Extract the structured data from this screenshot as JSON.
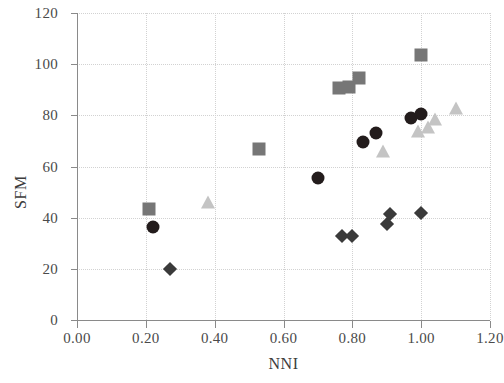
{
  "chart_data": {
    "type": "scatter",
    "title": "",
    "xlabel": "NNI",
    "ylabel": "SFM",
    "xlim": [
      0.0,
      1.2
    ],
    "ylim": [
      0,
      120
    ],
    "grid": true,
    "legend": "none",
    "xticks": [
      "0.00",
      "0.20",
      "0.40",
      "0.60",
      "0.80",
      "1.00",
      "1.20"
    ],
    "xtick_values": [
      0.0,
      0.2,
      0.4,
      0.6,
      0.8,
      1.0,
      1.2
    ],
    "yticks": [
      "0",
      "20",
      "40",
      "60",
      "80",
      "100",
      "120"
    ],
    "ytick_values": [
      0,
      20,
      40,
      60,
      80,
      100,
      120
    ],
    "series": [
      {
        "name": "squares",
        "marker": "square",
        "color": "#767676",
        "points": [
          {
            "x": 0.21,
            "y": 43.5
          },
          {
            "x": 0.53,
            "y": 67.0
          },
          {
            "x": 0.76,
            "y": 90.5
          },
          {
            "x": 0.79,
            "y": 91.0
          },
          {
            "x": 0.82,
            "y": 94.5
          },
          {
            "x": 1.0,
            "y": 103.5
          }
        ]
      },
      {
        "name": "circles",
        "marker": "circle",
        "color": "#231c1c",
        "points": [
          {
            "x": 0.22,
            "y": 36.5
          },
          {
            "x": 0.7,
            "y": 55.5
          },
          {
            "x": 0.83,
            "y": 69.5
          },
          {
            "x": 0.87,
            "y": 73.0
          },
          {
            "x": 0.97,
            "y": 79.0
          },
          {
            "x": 1.0,
            "y": 80.5
          }
        ]
      },
      {
        "name": "triangles",
        "marker": "triangle",
        "color": "#c4c4c4",
        "points": [
          {
            "x": 0.38,
            "y": 46.0
          },
          {
            "x": 0.89,
            "y": 66.0
          },
          {
            "x": 0.99,
            "y": 74.0
          },
          {
            "x": 1.02,
            "y": 75.5
          },
          {
            "x": 1.04,
            "y": 78.5
          },
          {
            "x": 1.1,
            "y": 83.0
          }
        ]
      },
      {
        "name": "diamonds",
        "marker": "diamond",
        "color": "#3a3a3a",
        "points": [
          {
            "x": 0.27,
            "y": 20.0
          },
          {
            "x": 0.77,
            "y": 33.0
          },
          {
            "x": 0.8,
            "y": 33.0
          },
          {
            "x": 0.9,
            "y": 37.5
          },
          {
            "x": 0.91,
            "y": 41.5
          },
          {
            "x": 1.0,
            "y": 42.0
          }
        ]
      }
    ]
  }
}
